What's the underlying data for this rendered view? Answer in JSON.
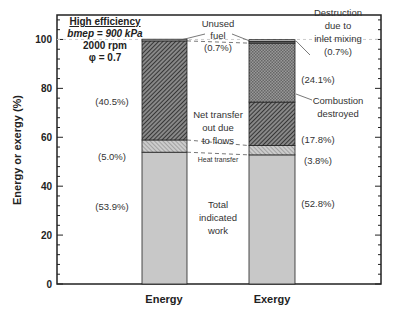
{
  "chart_data": {
    "type": "bar",
    "stacked": true,
    "title": "",
    "xlabel": "",
    "ylabel": "Energy or exergy (%)",
    "ylim": [
      0,
      110
    ],
    "yticks": [
      "0",
      "20",
      "40",
      "60",
      "80",
      "100"
    ],
    "categories": [
      "Energy",
      "Exergy"
    ],
    "conditions": {
      "heading": "High efficiency",
      "line1": "bmep = 900 kPa",
      "line2": "2000 rpm",
      "line3": "φ = 0.7"
    },
    "series": [
      {
        "name": "Total indicated work",
        "values": [
          53.9,
          52.8
        ],
        "labels": [
          "(53.9%)",
          "(52.8%)"
        ],
        "color": "#c8c8c8",
        "pattern": "solid"
      },
      {
        "name": "Heat transfer",
        "values": [
          5.0,
          3.8
        ],
        "labels": [
          "(5.0%)",
          "(3.8%)"
        ],
        "color": "#aaaaaa",
        "pattern": "light-hatch"
      },
      {
        "name": "Net transfer out due to flows",
        "values": [
          40.5,
          17.8
        ],
        "labels": [
          "(40.5%)",
          "(17.8%)"
        ],
        "color": "#444444",
        "pattern": "dense-hatch"
      },
      {
        "name": "Combustion destroyed",
        "values": [
          0,
          24.1
        ],
        "labels": [
          "",
          "(24.1%)"
        ],
        "color": "#888888",
        "pattern": "crosshatch"
      },
      {
        "name": "Destruction due to inlet mixing",
        "values": [
          0,
          0.7
        ],
        "labels": [
          "",
          "(0.7%)"
        ],
        "color": "#666666",
        "pattern": "solid"
      },
      {
        "name": "Unused fuel",
        "values": [
          0.7,
          0.7
        ],
        "labels": [
          "(0.7%)",
          ""
        ],
        "color": "#bbbbbb",
        "pattern": "solid"
      }
    ],
    "annotations": {
      "unused_fuel": [
        "Unused",
        "fuel",
        "(0.7%)"
      ],
      "net_transfer": [
        "Net transfer",
        "out due",
        "to flows"
      ],
      "heat_transfer": "Heat transfer",
      "total_work": [
        "Total",
        "indicated",
        "work"
      ],
      "destruction": [
        "Destruction",
        "due to",
        "inlet mixing",
        "(0.7%)"
      ],
      "combustion": [
        "Combustion",
        "destroyed"
      ]
    }
  }
}
